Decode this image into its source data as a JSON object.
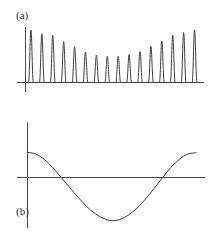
{
  "figure": {
    "background_color": "#ffffff",
    "line_color": "#3c3c3c",
    "axis_color": "#4a4a4a",
    "width": 213,
    "height": 231
  },
  "panels": [
    {
      "label": "(a)",
      "label_x": 16,
      "label_y": 10
    },
    {
      "label": "(b)",
      "label_x": 16,
      "label_y": 106
    }
  ],
  "chart_data": [
    {
      "type": "line",
      "title": "(a)",
      "subtitle": "",
      "xlabel": "",
      "ylabel": "",
      "description": "Train of sixteen narrow positive pulses with a U-shaped (beating) amplitude envelope: tall at both ends, lowest in the middle.",
      "grid": false,
      "legend": null,
      "xlim": [
        0,
        16
      ],
      "ylim": [
        0,
        1
      ],
      "baseline_y": 0,
      "pulse_count": 16,
      "pulse_half_width": 0.22,
      "pulse_centers": [
        0.5,
        1.5,
        2.5,
        3.5,
        4.5,
        5.5,
        6.5,
        7.5,
        8.5,
        9.5,
        10.5,
        11.5,
        12.5,
        13.5,
        14.5,
        15.5
      ],
      "pulse_amplitudes": [
        1.0,
        0.93,
        0.9,
        0.78,
        0.68,
        0.58,
        0.52,
        0.5,
        0.5,
        0.53,
        0.59,
        0.69,
        0.79,
        0.9,
        0.95,
        1.0
      ],
      "envelope_note": "|cos| style beat envelope, minimum near center",
      "axes": {
        "x_axis_visible": true,
        "y_axis_visible": true,
        "x_axis_pixel_y": 82,
        "y_axis_pixel_x": 25,
        "x_axis_pixel_from": 17,
        "x_axis_pixel_to": 204,
        "y_axis_pixel_from": 27,
        "y_axis_pixel_to": 92
      }
    },
    {
      "type": "line",
      "title": "(b)",
      "subtitle": "",
      "xlabel": "",
      "ylabel": "",
      "description": "Single smooth cosine-like wave: starts positive, falls through zero, reaches a broad minimum near the middle, then rises back through zero to a positive value at the right.",
      "grid": false,
      "legend": null,
      "xlim": [
        0,
        1
      ],
      "ylim": [
        -1,
        1
      ],
      "waveform": "cosine",
      "amplitude": 1.0,
      "cycles": 1.0,
      "phase_deg": 0,
      "x": [
        0.0,
        0.05,
        0.1,
        0.15,
        0.2,
        0.25,
        0.3,
        0.35,
        0.4,
        0.45,
        0.5,
        0.55,
        0.6,
        0.65,
        0.7,
        0.75,
        0.8,
        0.85,
        0.9,
        0.95,
        1.0
      ],
      "y": [
        0.56,
        0.52,
        0.4,
        0.22,
        0.0,
        -0.22,
        -0.44,
        -0.64,
        -0.8,
        -0.91,
        -0.96,
        -0.93,
        -0.83,
        -0.68,
        -0.48,
        -0.25,
        -0.01,
        0.22,
        0.4,
        0.52,
        0.55
      ],
      "zero_crossings": [
        0.2,
        0.8
      ],
      "minimum_at_x": 0.5,
      "minimum_value": -0.96,
      "axes": {
        "x_axis_visible": true,
        "y_axis_visible": true,
        "x_axis_pixel_y": 177,
        "y_axis_pixel_x": 27,
        "x_axis_pixel_from": 17,
        "x_axis_pixel_to": 205,
        "y_axis_pixel_from": 122,
        "y_axis_pixel_to": 228
      }
    }
  ]
}
